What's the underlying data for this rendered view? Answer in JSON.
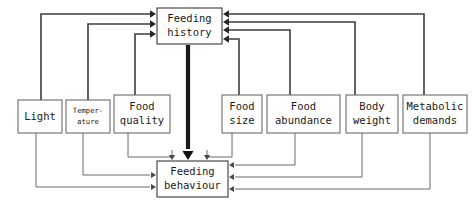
{
  "diagram": {
    "type": "flow-diagram",
    "canvas": {
      "width": 472,
      "height": 208
    },
    "colors": {
      "background": "#ffffff",
      "box_fill": "#ffffff",
      "box_stroke": "#5d5d5d",
      "thin_edge": "#6a6a6a",
      "mid_edge": "#3c3c3c",
      "thick_edge": "#1a1a1a",
      "text": "#1a1a1a"
    },
    "nodes": [
      {
        "id": "feeding-history",
        "label": "Feeding history",
        "lines": [
          "Feeding",
          "history"
        ],
        "x": 157,
        "y": 8,
        "w": 65,
        "h": 36,
        "font_size": 10.5,
        "role": "hub-top"
      },
      {
        "id": "light",
        "label": "Light",
        "lines": [
          "Light"
        ],
        "x": 18,
        "y": 100,
        "w": 44,
        "h": 33,
        "font_size": 10.5,
        "role": "source"
      },
      {
        "id": "temperature",
        "label": "Temperature",
        "lines": [
          "Temper-",
          "ature"
        ],
        "x": 66,
        "y": 100,
        "w": 44,
        "h": 33,
        "font_size": 7.2,
        "role": "source"
      },
      {
        "id": "food-quality",
        "label": "Food quality",
        "lines": [
          "Food",
          "quality"
        ],
        "x": 114,
        "y": 95,
        "w": 56,
        "h": 38,
        "font_size": 10.5,
        "role": "source"
      },
      {
        "id": "food-size",
        "label": "Food size",
        "lines": [
          "Food",
          "size"
        ],
        "x": 222,
        "y": 95,
        "w": 40,
        "h": 38,
        "font_size": 10.5,
        "role": "source"
      },
      {
        "id": "food-abundance",
        "label": "Food abundance",
        "lines": [
          "Food",
          "abundance"
        ],
        "x": 267,
        "y": 95,
        "w": 73,
        "h": 38,
        "font_size": 10.5,
        "role": "source"
      },
      {
        "id": "body-weight",
        "label": "Body weight",
        "lines": [
          "Body",
          "weight"
        ],
        "x": 346,
        "y": 95,
        "w": 52,
        "h": 38,
        "font_size": 10.5,
        "role": "source"
      },
      {
        "id": "metabolic-demands",
        "label": "Metabolic demands",
        "lines": [
          "Metabolic",
          "demands"
        ],
        "x": 403,
        "y": 95,
        "w": 64,
        "h": 38,
        "font_size": 10.5,
        "role": "source"
      },
      {
        "id": "feeding-behaviour",
        "label": "Feeding behaviour",
        "lines": [
          "Feeding",
          "behaviour"
        ],
        "x": 157,
        "y": 161,
        "w": 71,
        "h": 36,
        "font_size": 10.5,
        "role": "hub-bottom"
      }
    ],
    "edges": [
      {
        "id": "light-to-history",
        "from": "light",
        "to": "feeding-history",
        "weight": "mid",
        "path": "M 41,100 L 41,14 L 150,14",
        "head": {
          "x": 156,
          "y": 14,
          "dir": "right",
          "size": 6
        }
      },
      {
        "id": "temperature-to-history",
        "from": "temperature",
        "to": "feeding-history",
        "weight": "mid",
        "path": "M 88,100 L 88,24 L 150,24",
        "head": {
          "x": 156,
          "y": 24,
          "dir": "right",
          "size": 6
        }
      },
      {
        "id": "food-quality-to-history",
        "from": "food-quality",
        "to": "feeding-history",
        "weight": "mid",
        "path": "M 135,95 L 135,34 L 150,34",
        "head": {
          "x": 156,
          "y": 34,
          "dir": "right",
          "size": 6
        }
      },
      {
        "id": "food-size-to-history",
        "from": "food-size",
        "to": "feeding-history",
        "weight": "mid",
        "path": "M 239,95 L 239,39 L 229,39",
        "head": {
          "x": 223,
          "y": 39,
          "dir": "left",
          "size": 6
        }
      },
      {
        "id": "food-abundance-to-history",
        "from": "food-abundance",
        "to": "feeding-history",
        "weight": "mid",
        "path": "M 290,95 L 290,30 L 229,30",
        "head": {
          "x": 223,
          "y": 30,
          "dir": "left",
          "size": 6
        }
      },
      {
        "id": "body-weight-to-history",
        "from": "body-weight",
        "to": "feeding-history",
        "weight": "mid",
        "path": "M 355,95 L 355,22 L 229,22",
        "head": {
          "x": 223,
          "y": 22,
          "dir": "left",
          "size": 6
        }
      },
      {
        "id": "metabolic-demands-to-history",
        "from": "metabolic-demands",
        "to": "feeding-history",
        "weight": "mid",
        "path": "M 424,95 L 424,14 L 229,14",
        "head": {
          "x": 223,
          "y": 14,
          "dir": "left",
          "size": 6
        }
      },
      {
        "id": "history-to-behaviour",
        "from": "feeding-history",
        "to": "feeding-behaviour",
        "weight": "thick",
        "path": "M 188,45 L 188,149",
        "head": {
          "x": 188,
          "y": 160,
          "dir": "down",
          "size": 9
        }
      },
      {
        "id": "food-quality-to-behaviour",
        "from": "food-quality",
        "to": "feeding-behaviour",
        "weight": "thin",
        "path": "M 128,133 L 128,157 L 172,157 L 172,150",
        "head": {
          "x": 172,
          "y": 160,
          "dir": "down",
          "size": 5
        }
      },
      {
        "id": "food-size-to-behaviour",
        "from": "food-size",
        "to": "feeding-behaviour",
        "weight": "thin",
        "path": "M 232,133 L 232,157 L 207,157 L 207,150",
        "head": {
          "x": 207,
          "y": 160,
          "dir": "down",
          "size": 5
        }
      },
      {
        "id": "light-to-behaviour",
        "from": "light",
        "to": "feeding-behaviour",
        "weight": "thin",
        "path": "M 36,133 L 36,187 L 150,187",
        "head": {
          "x": 156,
          "y": 187,
          "dir": "right",
          "size": 5
        }
      },
      {
        "id": "temperature-to-behaviour",
        "from": "temperature",
        "to": "feeding-behaviour",
        "weight": "thin",
        "path": "M 83,133 L 83,175 L 150,175",
        "head": {
          "x": 156,
          "y": 175,
          "dir": "right",
          "size": 5
        }
      },
      {
        "id": "food-abundance-to-behaviour",
        "from": "food-abundance",
        "to": "feeding-behaviour",
        "weight": "thin",
        "path": "M 295,133 L 295,165 L 235,165",
        "head": {
          "x": 229,
          "y": 165,
          "dir": "left",
          "size": 5
        }
      },
      {
        "id": "body-weight-to-behaviour",
        "from": "body-weight",
        "to": "feeding-behaviour",
        "weight": "thin",
        "path": "M 362,133 L 362,177 L 235,177",
        "head": {
          "x": 229,
          "y": 177,
          "dir": "left",
          "size": 5
        }
      },
      {
        "id": "metabolic-to-behaviour",
        "from": "metabolic-demands",
        "to": "feeding-behaviour",
        "weight": "thin",
        "path": "M 430,133 L 430,189 L 235,189",
        "head": {
          "x": 229,
          "y": 189,
          "dir": "left",
          "size": 5
        }
      }
    ]
  }
}
